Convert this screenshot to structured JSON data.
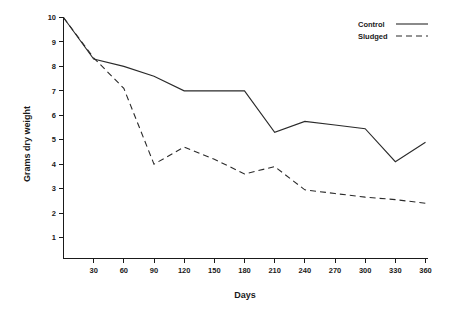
{
  "chart_data": {
    "type": "line",
    "title": "",
    "xlabel": "Days",
    "ylabel": "Grams dry weight",
    "x": [
      0,
      30,
      60,
      90,
      120,
      150,
      180,
      210,
      240,
      270,
      300,
      330,
      360
    ],
    "xticks": [
      30,
      60,
      90,
      120,
      150,
      180,
      210,
      240,
      270,
      300,
      330,
      360
    ],
    "yticks": [
      1,
      2,
      3,
      4,
      5,
      6,
      7,
      8,
      9,
      10
    ],
    "xlim": [
      0,
      370
    ],
    "ylim": [
      0,
      10
    ],
    "grid": false,
    "legend_position": "top-right",
    "series": [
      {
        "name": "Control",
        "style": "solid",
        "color": "#2a2a2a",
        "values": [
          10.0,
          8.3,
          8.0,
          7.6,
          7.0,
          7.0,
          7.0,
          5.3,
          5.75,
          5.6,
          5.45,
          4.1,
          4.9
        ]
      },
      {
        "name": "Sludged",
        "style": "dashed",
        "color": "#2a2a2a",
        "values": [
          10.0,
          8.35,
          7.1,
          4.0,
          4.7,
          4.2,
          3.6,
          3.9,
          2.95,
          2.8,
          2.65,
          2.55,
          2.4
        ]
      }
    ]
  },
  "axes": {
    "x_title": "Days",
    "y_title": "Grams dry weight",
    "x_tick_labels": [
      "30",
      "60",
      "90",
      "120",
      "150",
      "180",
      "210",
      "240",
      "270",
      "300",
      "330",
      "360"
    ],
    "y_tick_labels": [
      "1",
      "2",
      "3",
      "4",
      "5",
      "6",
      "7",
      "8",
      "9",
      "10"
    ]
  },
  "legend": {
    "entries": [
      {
        "label": "Control",
        "style": "solid"
      },
      {
        "label": "Sludged",
        "style": "dashed"
      }
    ]
  },
  "colors": {
    "line": "#2a2a2a",
    "axis": "#1a1a1a",
    "background": "#ffffff"
  }
}
